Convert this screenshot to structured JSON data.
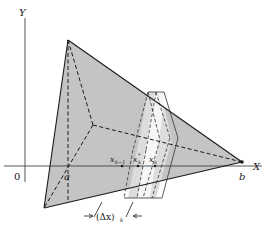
{
  "figure": {
    "type": "volume-by-slicing diagram",
    "colors": {
      "solid_fill": "#c4c4c4",
      "slab_fill": "#f4f4f4",
      "line": "#1a1a1a",
      "background": "#ffffff"
    },
    "labels": {
      "y_axis": "Y",
      "x_axis": "X",
      "origin": "0",
      "a": "a",
      "b": "b",
      "x_k_minus_1": "x",
      "x_k_minus_1_sub": "k−1",
      "x_k_star": "x",
      "x_k_star_sub": "k",
      "x_k_star_sup": "*",
      "x_k": "x",
      "x_k_sub": "k",
      "delta_x": "(Δx)",
      "delta_x_sub": "k"
    }
  }
}
